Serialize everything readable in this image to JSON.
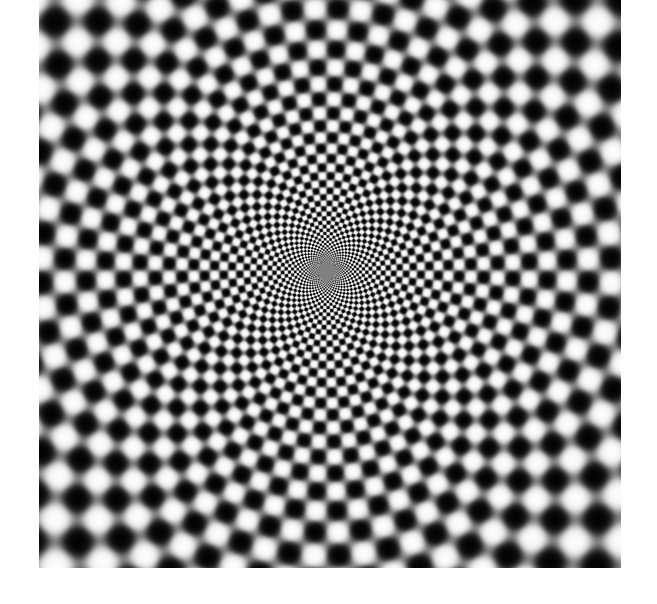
{
  "image": {
    "description": "Radial checkerboard optical illusion of blurred black and white dots converging to a center",
    "frame": {
      "x": 39,
      "y": 0,
      "width": 582,
      "height": 568
    },
    "pattern": {
      "type": "polar-checkerboard",
      "center": {
        "x": 287,
        "y": 270
      },
      "angular_segments": 72,
      "radial_log_step": 0.085,
      "min_radius": 6,
      "colors": {
        "dark": "#000000",
        "light": "#ffffff",
        "mid": "#808080"
      }
    },
    "background_color": "#ffffff"
  }
}
